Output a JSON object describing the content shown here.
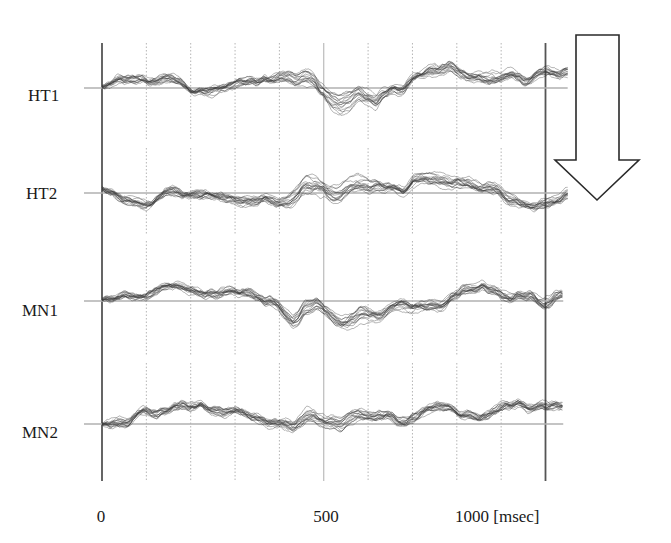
{
  "chart_data": {
    "type": "line",
    "title": "",
    "xlabel": "[msec]",
    "ylabel": "",
    "xlim": [
      0,
      1050
    ],
    "x_ticks": [
      {
        "value": 0,
        "label": "0"
      },
      {
        "value": 500,
        "label": "500"
      },
      {
        "value": 1000,
        "label": "1000 [msec]"
      }
    ],
    "grid": {
      "vertical_dotted_every_ms": 100,
      "solid_lines_ms": [
        0,
        500,
        1000
      ]
    },
    "series_unit": "relative amplitude (baseline = 0, positive = up)",
    "time_points_ms": [
      0,
      50,
      100,
      150,
      200,
      250,
      300,
      350,
      400,
      430,
      460,
      480,
      500,
      520,
      540,
      560,
      580,
      600,
      620,
      640,
      660,
      680,
      700,
      750,
      800,
      850,
      900,
      950,
      1000,
      1050
    ],
    "rows": [
      {
        "label": "HT1",
        "trace_end_ms": 1050,
        "mean": [
          0.1,
          0.2,
          0.0,
          0.2,
          0.1,
          0.2,
          0.0,
          0.2,
          0.2,
          0.4,
          0.6,
          0.4,
          0.0,
          -0.6,
          -1.0,
          -0.8,
          -0.4,
          -0.6,
          -0.9,
          -0.4,
          0.0,
          -0.4,
          0.1,
          0.5,
          0.6,
          0.9,
          0.6,
          0.4,
          0.2,
          0.4
        ],
        "spread": [
          0.1,
          0.1,
          0.1,
          0.1,
          0.1,
          0.1,
          0.1,
          0.1,
          0.2,
          0.4,
          0.6,
          0.5,
          0.4,
          0.7,
          0.9,
          0.8,
          0.5,
          0.5,
          0.6,
          0.3,
          0.2,
          0.2,
          0.2,
          0.3,
          0.3,
          0.3,
          0.3,
          0.2,
          0.2,
          0.2
        ]
      },
      {
        "label": "HT2",
        "trace_end_ms": 1050,
        "mean": [
          0.5,
          0.2,
          0.3,
          0.1,
          0.2,
          0.3,
          0.1,
          0.4,
          0.3,
          0.6,
          1.1,
          0.7,
          0.0,
          -0.8,
          -1.1,
          -0.8,
          -0.6,
          -0.5,
          -0.4,
          -0.2,
          0.0,
          -0.3,
          0.2,
          0.6,
          0.8,
          0.8,
          0.6,
          0.5,
          0.3,
          0.4
        ],
        "spread": [
          0.2,
          0.2,
          0.2,
          0.2,
          0.2,
          0.2,
          0.2,
          0.2,
          0.3,
          0.6,
          0.9,
          0.7,
          0.5,
          0.8,
          0.9,
          0.7,
          0.6,
          0.5,
          0.4,
          0.3,
          0.3,
          0.3,
          0.3,
          0.4,
          0.4,
          0.4,
          0.4,
          0.3,
          0.3,
          0.3
        ]
      },
      {
        "label": "MN1",
        "trace_end_ms": 1040,
        "mean": [
          0.1,
          0.1,
          0.0,
          0.1,
          0.0,
          0.2,
          0.1,
          0.0,
          0.1,
          -0.6,
          0.7,
          0.4,
          -0.1,
          -0.4,
          -0.6,
          -0.5,
          -0.6,
          -0.5,
          -0.4,
          -0.2,
          -0.1,
          0.2,
          0.0,
          0.4,
          0.3,
          0.6,
          0.5,
          0.4,
          0.3,
          0.2
        ],
        "spread": [
          0.1,
          0.1,
          0.1,
          0.1,
          0.1,
          0.1,
          0.1,
          0.1,
          0.2,
          0.3,
          0.8,
          0.6,
          0.4,
          0.5,
          0.5,
          0.5,
          0.5,
          0.4,
          0.3,
          0.2,
          0.2,
          0.2,
          0.2,
          0.2,
          0.2,
          0.3,
          0.3,
          0.2,
          0.2,
          0.2
        ]
      },
      {
        "label": "MN2",
        "trace_end_ms": 1040,
        "mean": [
          0.0,
          0.1,
          0.2,
          0.0,
          0.1,
          0.1,
          0.2,
          0.1,
          0.1,
          -0.7,
          0.5,
          0.4,
          0.0,
          -0.5,
          -0.8,
          -0.6,
          -0.3,
          -0.3,
          -0.2,
          -0.1,
          0.0,
          -0.1,
          0.3,
          0.4,
          0.5,
          0.3,
          0.5,
          0.3,
          0.2,
          0.2
        ],
        "spread": [
          0.1,
          0.1,
          0.1,
          0.1,
          0.1,
          0.1,
          0.1,
          0.1,
          0.2,
          0.3,
          0.7,
          0.6,
          0.5,
          0.7,
          0.8,
          0.6,
          0.4,
          0.3,
          0.2,
          0.2,
          0.2,
          0.2,
          0.2,
          0.2,
          0.2,
          0.2,
          0.2,
          0.2,
          0.2,
          0.2
        ]
      }
    ],
    "overlaid_traces_per_row": 16,
    "annotation": {
      "type": "arrow",
      "direction": "down",
      "meaning": "order from top to bottom"
    }
  },
  "colors": {
    "trace": "#3a3a3a",
    "baseline": "#b0b0b0",
    "grid": "#b5b5b5",
    "axis": "#555555",
    "arrow_stroke": "#2a2a2a",
    "arrow_fill": "#ffffff"
  }
}
